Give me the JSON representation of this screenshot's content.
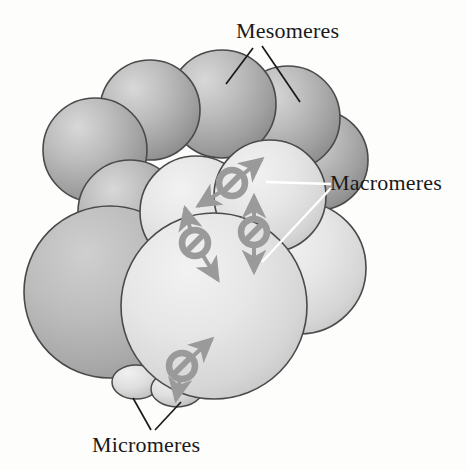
{
  "figure": {
    "type": "biological-diagram",
    "background_color": "#fdfdfc"
  },
  "labels": {
    "mesomeres": {
      "text": "Mesomeres",
      "x": 236,
      "y": 38,
      "leader_color": "#1a1a1a"
    },
    "macromeres": {
      "text": "Macromeres",
      "x": 330,
      "y": 190,
      "leader_color": "#ffffff"
    },
    "micromeres": {
      "text": "Micromeres",
      "x": 92,
      "y": 452,
      "leader_color": "#1a1a1a"
    }
  },
  "colors": {
    "mesomere_light": "#c8c8c8",
    "mesomere_mid": "#a8a8a8",
    "mesomere_dark": "#8a8a8a",
    "macromere_light": "#ececec",
    "macromere_mid": "#dcdcdc",
    "macromere_dark": "#c2c2c2",
    "micromere_light": "#e8e8e8",
    "outline": "#4a4a4a",
    "symbol_gray": "#9a9a9a",
    "arrow_gray": "#9a9a9a",
    "text": "#1a1a1a"
  },
  "cells": {
    "mesomeres": [
      {
        "id": "meso-1",
        "cx": 98,
        "cy": 148,
        "r": 52
      },
      {
        "id": "meso-2",
        "cx": 152,
        "cy": 110,
        "r": 50
      },
      {
        "id": "meso-3",
        "cx": 224,
        "cy": 105,
        "r": 52
      },
      {
        "id": "meso-4",
        "cx": 288,
        "cy": 120,
        "r": 50
      },
      {
        "id": "meso-5",
        "cx": 318,
        "cy": 160,
        "r": 48
      },
      {
        "id": "meso-6",
        "cx": 128,
        "cy": 210,
        "r": 50
      }
    ],
    "macromeres": [
      {
        "id": "macro-left",
        "cx": 112,
        "cy": 290,
        "r": 84
      },
      {
        "id": "macro-upper",
        "cx": 196,
        "cy": 212,
        "r": 54
      },
      {
        "id": "macro-right",
        "cx": 268,
        "cy": 196,
        "r": 54
      },
      {
        "id": "macro-far-right",
        "cx": 306,
        "cy": 270,
        "r": 64
      },
      {
        "id": "macro-front",
        "cx": 212,
        "cy": 308,
        "r": 92
      }
    ],
    "micromeres": [
      {
        "id": "micro-1",
        "cx": 136,
        "cy": 383,
        "rx": 23,
        "ry": 16
      },
      {
        "id": "micro-2",
        "cx": 176,
        "cy": 389,
        "rx": 25,
        "ry": 17
      }
    ]
  },
  "signal_symbols": [
    {
      "id": "block-1",
      "cx": 232,
      "cy": 183,
      "r": 13,
      "meaning": "blocked-signal",
      "arrows": [
        {
          "angle": -40,
          "length": 30
        },
        {
          "angle": 140,
          "length": 30
        }
      ]
    },
    {
      "id": "block-2",
      "cx": 195,
      "cy": 243,
      "r": 13,
      "meaning": "blocked-signal",
      "arrows": [
        {
          "angle": -65,
          "length": 30
        },
        {
          "angle": 60,
          "length": 32
        }
      ]
    },
    {
      "id": "block-3",
      "cx": 254,
      "cy": 232,
      "r": 13,
      "meaning": "blocked-signal",
      "arrows": [
        {
          "angle": -90,
          "length": 32
        },
        {
          "angle": 90,
          "length": 32
        }
      ]
    },
    {
      "id": "block-4",
      "cx": 182,
      "cy": 366,
      "r": 13,
      "meaning": "blocked-signal",
      "arrows": [
        {
          "angle": -48,
          "length": 32
        },
        {
          "angle": 100,
          "length": 28
        }
      ]
    }
  ],
  "leaders": {
    "mesomeres": [
      {
        "x1": 253,
        "y1": 48,
        "x2": 224,
        "y2": 80
      },
      {
        "x1": 268,
        "y1": 48,
        "x2": 298,
        "y2": 100
      }
    ],
    "macromeres": [
      {
        "x1": 328,
        "y1": 184,
        "x2": 268,
        "y2": 182
      },
      {
        "x1": 328,
        "y1": 188,
        "x2": 268,
        "y2": 258
      }
    ],
    "micromeres": [
      {
        "x1": 152,
        "y1": 432,
        "x2": 134,
        "y2": 398
      },
      {
        "x1": 155,
        "y1": 432,
        "x2": 180,
        "y2": 400
      }
    ]
  }
}
